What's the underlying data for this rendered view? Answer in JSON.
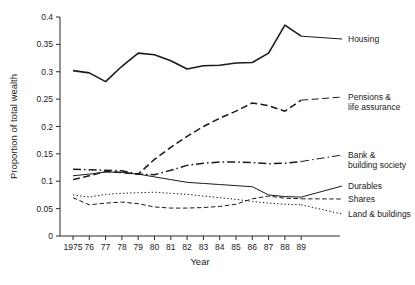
{
  "chart_data": {
    "type": "line",
    "title": "",
    "xlabel": "Year",
    "ylabel": "Proportion of total wealth",
    "grid": false,
    "legend_position": "right-inline-labels",
    "xlim": [
      1975,
      1989
    ],
    "ylim": [
      0,
      0.4
    ],
    "yticks": [
      "0",
      "0.05",
      "0.1",
      "0.15",
      "0.2",
      "0.25",
      "0.3",
      "0.35",
      "0.4"
    ],
    "ytick_values": [
      0,
      0.05,
      0.1,
      0.15,
      0.2,
      0.25,
      0.3,
      0.35,
      0.4
    ],
    "x": [
      1975,
      1976,
      1977,
      1978,
      1979,
      1980,
      1981,
      1982,
      1983,
      1984,
      1985,
      1986,
      1987,
      1988,
      1989
    ],
    "xticks": [
      "1975",
      "76",
      "77",
      "78",
      "79",
      "80",
      "81",
      "82",
      "83",
      "84",
      "85",
      "86",
      "87",
      "88",
      "89"
    ],
    "series": [
      {
        "name": "Housing",
        "label": "Housing",
        "style": "solid",
        "stroke_width": 1.6,
        "color": "#1b1b1b",
        "values": [
          0.302,
          0.298,
          0.282,
          0.31,
          0.334,
          0.331,
          0.32,
          0.305,
          0.311,
          0.312,
          0.316,
          0.317,
          0.334,
          0.385,
          0.365
        ]
      },
      {
        "name": "Pensions & life assurance",
        "label": "Pensions &\nlife assurance",
        "label_line1": "Pensions &",
        "label_line2": "life assurance",
        "style": "dashed",
        "stroke_width": 1.5,
        "color": "#1b1b1b",
        "values": [
          0.103,
          0.11,
          0.118,
          0.116,
          0.113,
          0.14,
          0.162,
          0.182,
          0.2,
          0.215,
          0.228,
          0.243,
          0.238,
          0.228,
          0.248
        ]
      },
      {
        "name": "Bank & building society",
        "label": "Bank &\nbuilding society",
        "label_line1": "Bank &",
        "label_line2": "building society",
        "style": "dashdot",
        "stroke_width": 1.5,
        "color": "#1b1b1b",
        "values": [
          0.122,
          0.121,
          0.12,
          0.119,
          0.113,
          0.112,
          0.12,
          0.129,
          0.133,
          0.135,
          0.135,
          0.134,
          0.132,
          0.133,
          0.136
        ]
      },
      {
        "name": "Durables",
        "label": "Durables",
        "style": "solid",
        "stroke_width": 1.0,
        "color": "#1b1b1b",
        "values": [
          0.11,
          0.113,
          0.117,
          0.116,
          0.113,
          0.108,
          0.103,
          0.098,
          0.096,
          0.094,
          0.092,
          0.09,
          0.075,
          0.072,
          0.071
        ]
      },
      {
        "name": "Shares",
        "label": "Shares",
        "style": "dashed-fine",
        "stroke_width": 1.0,
        "color": "#1b1b1b",
        "values": [
          0.07,
          0.057,
          0.06,
          0.062,
          0.059,
          0.053,
          0.051,
          0.051,
          0.052,
          0.054,
          0.058,
          0.068,
          0.073,
          0.069,
          0.068
        ]
      },
      {
        "name": "Land & buildings",
        "label": "Land & buildings",
        "style": "dotted",
        "stroke_width": 1.0,
        "color": "#1b1b1b",
        "values": [
          0.075,
          0.071,
          0.076,
          0.078,
          0.079,
          0.08,
          0.078,
          0.076,
          0.073,
          0.07,
          0.067,
          0.063,
          0.06,
          0.058,
          0.057
        ]
      }
    ],
    "annotations": [
      {
        "text": "Housing",
        "for": "Housing"
      },
      {
        "text": "Pensions & life assurance",
        "for": "Pensions & life assurance"
      },
      {
        "text": "Bank & building society",
        "for": "Bank & building society"
      },
      {
        "text": "Durables",
        "for": "Durables"
      },
      {
        "text": "Shares",
        "for": "Shares"
      },
      {
        "text": "Land & buildings",
        "for": "Land & buildings"
      }
    ]
  }
}
